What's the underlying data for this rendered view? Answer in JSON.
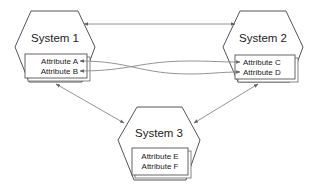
{
  "diagram": {
    "systems": [
      {
        "id": "system1",
        "title": "System 1",
        "attributes": [
          "Attribute A",
          "Attribute B"
        ]
      },
      {
        "id": "system2",
        "title": "System 2",
        "attributes": [
          "Attribute C",
          "Attribute D"
        ]
      },
      {
        "id": "system3",
        "title": "System 3",
        "attributes": [
          "Attribute E",
          "Attribute F"
        ]
      }
    ],
    "connections": [
      {
        "from": "System 1",
        "to": "System 2",
        "type": "bidirectional"
      },
      {
        "from": "Attribute A",
        "to": "Attribute D",
        "type": "bidirectional-crossing"
      },
      {
        "from": "Attribute B",
        "to": "Attribute C",
        "type": "bidirectional-crossing"
      },
      {
        "from": "System 1",
        "to": "System 3",
        "type": "bidirectional"
      },
      {
        "from": "System 2",
        "to": "System 3",
        "type": "bidirectional"
      }
    ],
    "colors": {
      "stroke": "#555555",
      "line": "#888888",
      "fill": "#ffffff",
      "text": "#222222"
    }
  }
}
